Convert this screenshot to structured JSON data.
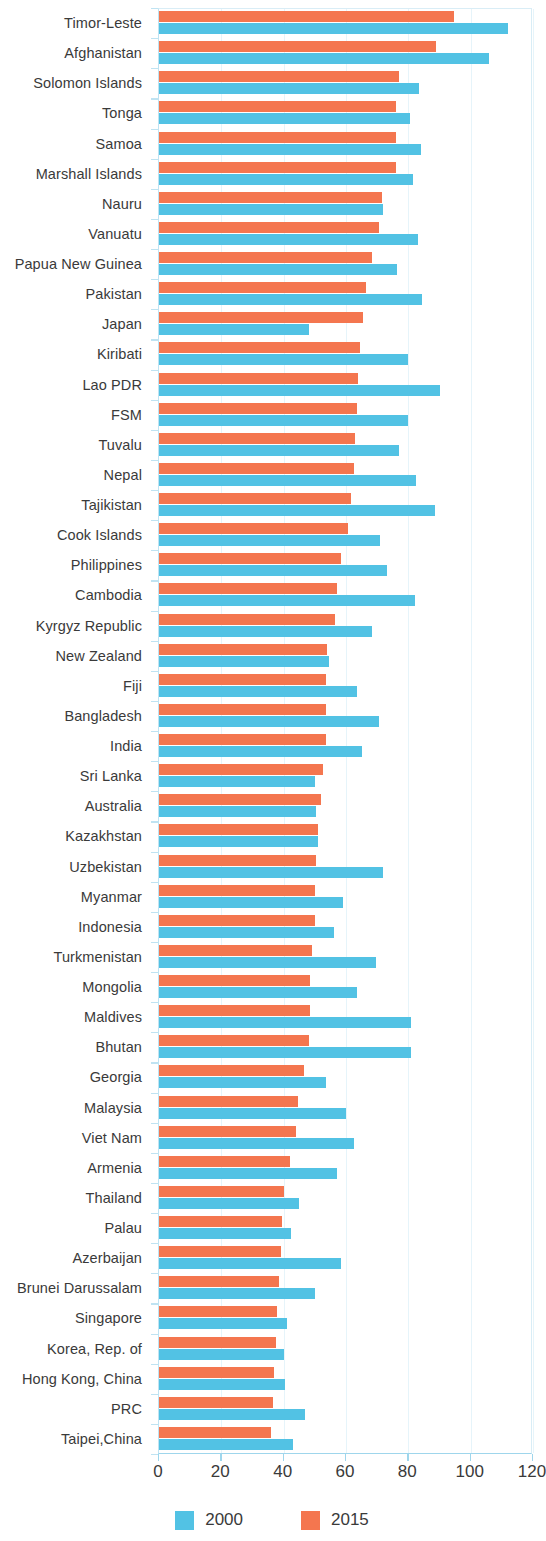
{
  "chart_data": {
    "type": "bar",
    "orientation": "horizontal",
    "title": "",
    "subtitle": "",
    "xlabel": "",
    "ylabel": "",
    "xlim": [
      0,
      120
    ],
    "xticks": [
      0,
      20,
      40,
      60,
      80,
      100,
      120
    ],
    "grid": true,
    "legend_position": "bottom",
    "colors": {
      "2000": "#52c2e4",
      "2015": "#f4764f"
    },
    "categories": [
      "Timor-Leste",
      "Afghanistan",
      "Solomon Islands",
      "Tonga",
      "Samoa",
      "Marshall Islands",
      "Nauru",
      "Vanuatu",
      "Papua New Guinea",
      "Pakistan",
      "Japan",
      "Kiribati",
      "Lao PDR",
      "FSM",
      "Tuvalu",
      "Nepal",
      "Tajikistan",
      "Cook Islands",
      "Philippines",
      "Cambodia",
      "Kyrgyz Republic",
      "New Zealand",
      "Fiji",
      "Bangladesh",
      "India",
      "Sri Lanka",
      "Australia",
      "Kazakhstan",
      "Uzbekistan",
      "Myanmar",
      "Indonesia",
      "Turkmenistan",
      "Mongolia",
      "Maldives",
      "Bhutan",
      "Georgia",
      "Malaysia",
      "Viet Nam",
      "Armenia",
      "Thailand",
      "Palau",
      "Azerbaijan",
      "Brunei Darussalam",
      "Singapore",
      "Korea, Rep. of",
      "Hong Kong, China",
      "PRC",
      "Taipei,China"
    ],
    "series": [
      {
        "name": "2000",
        "color": "#52c2e4",
        "values": [
          112.0,
          106.0,
          83.5,
          80.5,
          84.0,
          81.5,
          72.0,
          83.0,
          76.5,
          84.5,
          48.0,
          80.0,
          90.0,
          80.0,
          77.0,
          82.5,
          88.5,
          71.0,
          73.0,
          82.0,
          68.5,
          54.5,
          63.5,
          70.5,
          65.0,
          50.0,
          50.5,
          51.0,
          72.0,
          59.0,
          56.0,
          69.5,
          63.5,
          81.0,
          81.0,
          53.5,
          60.0,
          62.5,
          57.0,
          45.0,
          42.5,
          58.5,
          50.0,
          41.0,
          40.0,
          40.5,
          47.0,
          43.0
        ]
      },
      {
        "name": "2015",
        "color": "#f4764f",
        "values": [
          94.5,
          89.0,
          77.0,
          76.0,
          76.0,
          76.0,
          71.5,
          70.5,
          68.5,
          66.5,
          65.5,
          64.5,
          64.0,
          63.5,
          63.0,
          62.5,
          61.5,
          60.5,
          58.5,
          57.0,
          56.5,
          54.0,
          53.5,
          53.5,
          53.5,
          52.5,
          52.0,
          51.0,
          50.5,
          50.0,
          50.0,
          49.0,
          48.5,
          48.5,
          48.0,
          46.5,
          44.5,
          44.0,
          42.0,
          40.0,
          39.5,
          39.0,
          38.5,
          38.0,
          37.5,
          37.0,
          36.5,
          36.0
        ]
      }
    ],
    "legend": [
      {
        "label": "2000",
        "color": "#52c2e4"
      },
      {
        "label": "2015",
        "color": "#f4764f"
      }
    ]
  }
}
